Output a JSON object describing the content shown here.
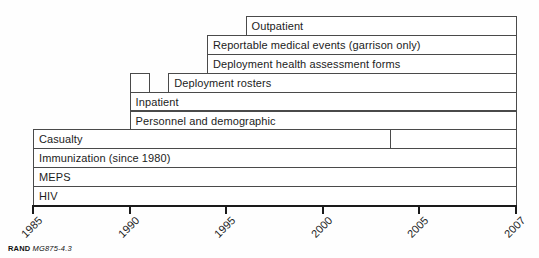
{
  "figure": {
    "footer": {
      "brand": "RAND",
      "figure_id": "MG875-4.3"
    }
  },
  "chart_data": {
    "type": "bar",
    "subtype": "timeline-availability",
    "title": "",
    "xlabel": "",
    "ylabel": "",
    "x_axis": {
      "range": [
        1985,
        2007
      ],
      "tick_years": [
        1985,
        1990,
        1995,
        2000,
        2005,
        2007
      ],
      "tick_labels": [
        "1985",
        "1990",
        "1995",
        "2000",
        "2005",
        "2007"
      ],
      "ticks_evenly_spaced": true,
      "tick_label_rotation_deg": -45
    },
    "rows": [
      {
        "label": "Outpatient",
        "segments": [
          {
            "start": 1996,
            "end": 2007
          }
        ]
      },
      {
        "label": "Reportable medical events (garrison only)",
        "segments": [
          {
            "start": 1994,
            "end": 2007
          }
        ]
      },
      {
        "label": "Deployment health assessment forms",
        "segments": [
          {
            "start": 1994,
            "end": 2007
          }
        ]
      },
      {
        "label": "Deployment rosters",
        "segments": [
          {
            "start": 1990,
            "end": 1991
          },
          {
            "start": 1992,
            "end": 2007
          }
        ]
      },
      {
        "label": "Inpatient",
        "segments": [
          {
            "start": 1990,
            "end": 2007
          }
        ]
      },
      {
        "label": "Personnel and demographic",
        "segments": [
          {
            "start": 1990,
            "end": 2007
          }
        ]
      },
      {
        "label": "Casualty",
        "segments": [
          {
            "start": 1985,
            "end": 2003.5
          },
          {
            "start": 2003.5,
            "end": 2007
          }
        ]
      },
      {
        "label": "Immunization (since 1980)",
        "segments": [
          {
            "start": 1985,
            "end": 2007
          }
        ]
      },
      {
        "label": "MEPS",
        "segments": [
          {
            "start": 1985,
            "end": 2007
          }
        ]
      },
      {
        "label": "HIV",
        "segments": [
          {
            "start": 1985,
            "end": 2007
          }
        ]
      }
    ],
    "colors": {
      "bar_fill": "#ffffff",
      "bar_border": "#4a4a4a",
      "axis": "#1a1a1a",
      "text": "#1c1c1c"
    },
    "legend": null,
    "grid": false
  }
}
